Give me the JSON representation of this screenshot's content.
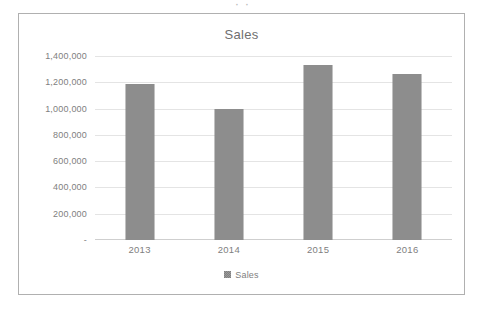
{
  "page": {
    "fragment_text": "· ·"
  },
  "chart": {
    "title": "Sales",
    "legend": {
      "position": "bottom",
      "entries": [
        {
          "label": "Sales",
          "color": "#7f7f7f",
          "marker": "square-swatch"
        }
      ]
    },
    "frame_border_color": "#b0b0b0",
    "gridline_color": "#e4e4e4",
    "axis_text_color": "#808080"
  },
  "chart_data": {
    "type": "bar",
    "title": "Sales",
    "xlabel": "",
    "ylabel": "",
    "categories": [
      "2013",
      "2014",
      "2015",
      "2016"
    ],
    "series": [
      {
        "name": "Sales",
        "color": "#7f7f7f",
        "values": [
          1190000,
          1000000,
          1330000,
          1260000
        ]
      }
    ],
    "ylim": [
      0,
      1400000
    ],
    "ytick_values": [
      0,
      200000,
      400000,
      600000,
      800000,
      1000000,
      1200000,
      1400000
    ],
    "ytick_labels": [
      "-",
      "200,000",
      "400,000",
      "600,000",
      "800,000",
      "1,000,000",
      "1,200,000",
      "1,400,000"
    ],
    "grid": true,
    "grid_axis": "y",
    "legend_position": "bottom"
  }
}
